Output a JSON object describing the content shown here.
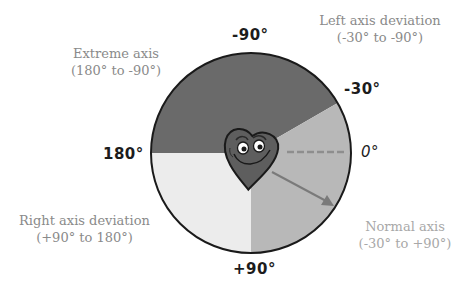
{
  "diagram": {
    "type": "hexaxial-axis-wheel",
    "center": [
      251,
      153
    ],
    "radius": 100,
    "colors": {
      "extreme": "#6a6a6a",
      "left": "#6a6a6a",
      "normal": "#b8b8b8",
      "right": "#ececec",
      "outline": "#1a1a1a",
      "heart": "#5e5e5e",
      "arrow": "#7a7a7a",
      "dashed_ref": "#8e8e8e"
    }
  },
  "degree_labels": {
    "minus90": "-90°",
    "minus30": "-30°",
    "zero": "0°",
    "plus90": "+90°",
    "deg180": "180°"
  },
  "regions": {
    "extreme": {
      "title": "Extreme axis",
      "range": "(180° to -90°)"
    },
    "left": {
      "title": "Left axis deviation",
      "range": "(-30° to -90°)"
    },
    "right": {
      "title": "Right axis deviation",
      "range": "(+90° to 180°)"
    },
    "normal": {
      "title": "Normal axis",
      "range": "(-30° to +90°)"
    }
  },
  "icons": {
    "heart": "heart-mascot-icon",
    "arrow": "axis-arrow-icon"
  }
}
